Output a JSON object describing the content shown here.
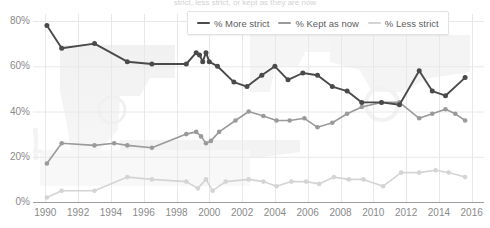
{
  "caption": "strict, less strict, or kept as they are now",
  "legend": {
    "position": "top-center",
    "items": [
      {
        "label": "% More strict",
        "color": "#4a4a4a",
        "icon": "line-swatch"
      },
      {
        "label": "% Kept as now",
        "color": "#9a9a9a",
        "icon": "line-swatch"
      },
      {
        "label": "% Less strict",
        "color": "#d4d4d4",
        "icon": "line-swatch"
      }
    ]
  },
  "axes": {
    "y_ticks": [
      "0%",
      "20%",
      "40%",
      "60%",
      "80%"
    ],
    "x_ticks": [
      "1990",
      "1992",
      "1994",
      "1996",
      "1998",
      "2000",
      "2002",
      "2004",
      "2006",
      "2008",
      "2010",
      "2012",
      "2014",
      "2016"
    ]
  },
  "colors": {
    "more_strict": "#4a4a4a",
    "kept_as_now": "#9a9a9a",
    "less_strict": "#d4d4d4",
    "grid": "#e8e8e8",
    "axis": "#9d9d9d",
    "tick_text": "#8a8a8a"
  },
  "chart_data": {
    "type": "line",
    "title": "",
    "subtitle": "strict, less strict, or kept as they are now",
    "xlabel": "",
    "ylabel": "",
    "xlim": [
      1990,
      2016
    ],
    "ylim": [
      0,
      80
    ],
    "grid": true,
    "y_tick_values": [
      0,
      20,
      40,
      60,
      80
    ],
    "x_tick_values": [
      1990,
      1992,
      1994,
      1996,
      1998,
      2000,
      2002,
      2004,
      2006,
      2008,
      2010,
      2012,
      2014,
      2016
    ],
    "series": [
      {
        "name": "% More strict",
        "color": "#4a4a4a",
        "points": [
          {
            "x": 1990.1,
            "y": 78
          },
          {
            "x": 1991.0,
            "y": 68
          },
          {
            "x": 1993.0,
            "y": 70
          },
          {
            "x": 1995.0,
            "y": 62
          },
          {
            "x": 1996.5,
            "y": 61
          },
          {
            "x": 1998.6,
            "y": 61
          },
          {
            "x": 1999.2,
            "y": 66
          },
          {
            "x": 1999.4,
            "y": 65
          },
          {
            "x": 1999.6,
            "y": 62
          },
          {
            "x": 1999.8,
            "y": 66
          },
          {
            "x": 2000.0,
            "y": 62
          },
          {
            "x": 2000.5,
            "y": 60
          },
          {
            "x": 2001.5,
            "y": 53
          },
          {
            "x": 2002.3,
            "y": 51
          },
          {
            "x": 2003.2,
            "y": 56
          },
          {
            "x": 2004.0,
            "y": 60
          },
          {
            "x": 2004.8,
            "y": 54
          },
          {
            "x": 2005.7,
            "y": 57
          },
          {
            "x": 2006.6,
            "y": 56
          },
          {
            "x": 2007.5,
            "y": 51
          },
          {
            "x": 2008.4,
            "y": 49
          },
          {
            "x": 2009.3,
            "y": 44
          },
          {
            "x": 2010.5,
            "y": 44
          },
          {
            "x": 2011.6,
            "y": 43
          },
          {
            "x": 2012.8,
            "y": 58
          },
          {
            "x": 2013.6,
            "y": 49
          },
          {
            "x": 2014.4,
            "y": 47
          },
          {
            "x": 2015.6,
            "y": 55
          }
        ]
      },
      {
        "name": "% Kept as now",
        "color": "#9a9a9a",
        "points": [
          {
            "x": 1990.1,
            "y": 17
          },
          {
            "x": 1991.0,
            "y": 26
          },
          {
            "x": 1993.0,
            "y": 25
          },
          {
            "x": 1994.2,
            "y": 26
          },
          {
            "x": 1995.0,
            "y": 25
          },
          {
            "x": 1996.5,
            "y": 24
          },
          {
            "x": 1998.6,
            "y": 30
          },
          {
            "x": 1999.2,
            "y": 31
          },
          {
            "x": 1999.5,
            "y": 29
          },
          {
            "x": 1999.8,
            "y": 26
          },
          {
            "x": 2000.1,
            "y": 27
          },
          {
            "x": 2000.6,
            "y": 31
          },
          {
            "x": 2001.6,
            "y": 36
          },
          {
            "x": 2002.4,
            "y": 40
          },
          {
            "x": 2003.3,
            "y": 38
          },
          {
            "x": 2004.1,
            "y": 36
          },
          {
            "x": 2004.9,
            "y": 36
          },
          {
            "x": 2005.8,
            "y": 37
          },
          {
            "x": 2006.6,
            "y": 33
          },
          {
            "x": 2007.5,
            "y": 35
          },
          {
            "x": 2008.4,
            "y": 39
          },
          {
            "x": 2009.3,
            "y": 42
          },
          {
            "x": 2010.5,
            "y": 44
          },
          {
            "x": 2011.6,
            "y": 44
          },
          {
            "x": 2012.8,
            "y": 37
          },
          {
            "x": 2013.6,
            "y": 39
          },
          {
            "x": 2014.4,
            "y": 41
          },
          {
            "x": 2015.0,
            "y": 39
          },
          {
            "x": 2015.6,
            "y": 36
          }
        ]
      },
      {
        "name": "% Less strict",
        "color": "#d4d4d4",
        "points": [
          {
            "x": 1990.1,
            "y": 2
          },
          {
            "x": 1991.0,
            "y": 5
          },
          {
            "x": 1993.0,
            "y": 5
          },
          {
            "x": 1995.0,
            "y": 11
          },
          {
            "x": 1996.5,
            "y": 10
          },
          {
            "x": 1998.6,
            "y": 9
          },
          {
            "x": 1999.3,
            "y": 6
          },
          {
            "x": 1999.8,
            "y": 10
          },
          {
            "x": 2000.2,
            "y": 5
          },
          {
            "x": 2001.0,
            "y": 9
          },
          {
            "x": 2002.4,
            "y": 10
          },
          {
            "x": 2003.3,
            "y": 9
          },
          {
            "x": 2004.1,
            "y": 7
          },
          {
            "x": 2005.0,
            "y": 9
          },
          {
            "x": 2005.9,
            "y": 9
          },
          {
            "x": 2006.7,
            "y": 8
          },
          {
            "x": 2007.6,
            "y": 11
          },
          {
            "x": 2008.5,
            "y": 10
          },
          {
            "x": 2009.4,
            "y": 10
          },
          {
            "x": 2010.6,
            "y": 7
          },
          {
            "x": 2011.7,
            "y": 13
          },
          {
            "x": 2012.8,
            "y": 13
          },
          {
            "x": 2013.8,
            "y": 14
          },
          {
            "x": 2014.6,
            "y": 13
          },
          {
            "x": 2015.6,
            "y": 11
          }
        ]
      }
    ]
  }
}
